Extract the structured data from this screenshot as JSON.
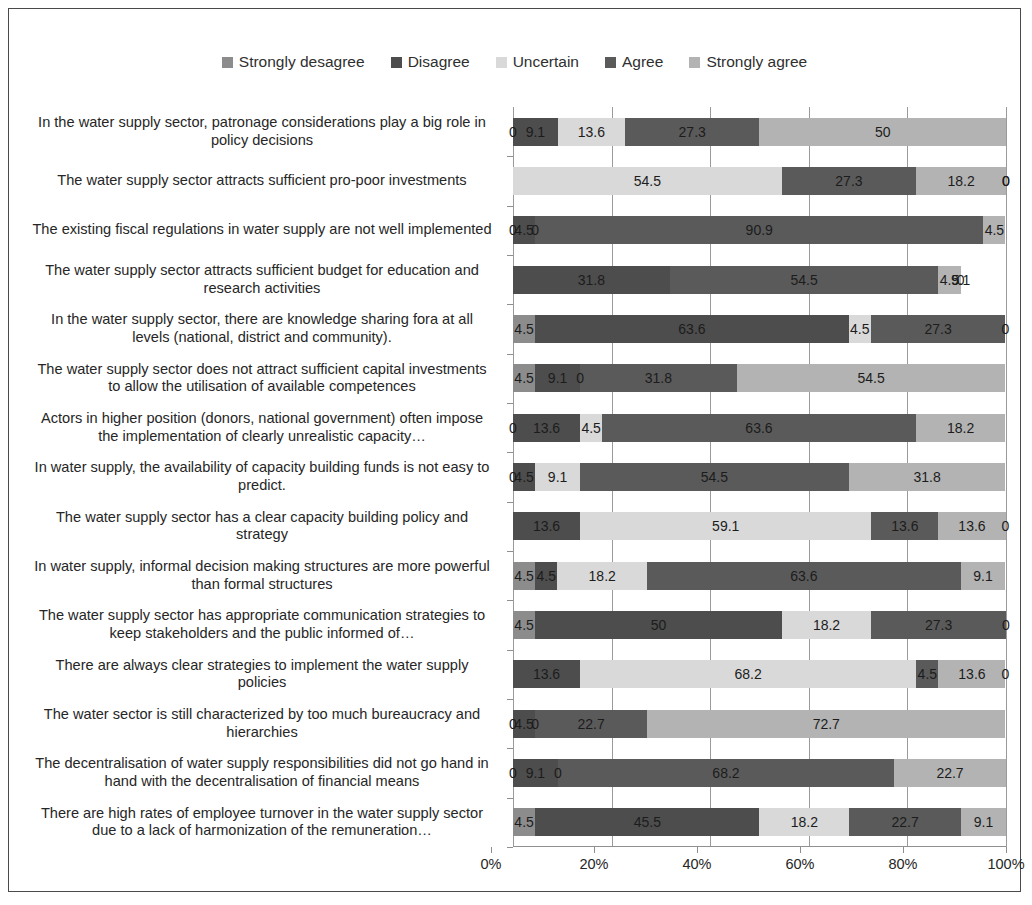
{
  "chart_data": {
    "type": "bar",
    "subtype": "stacked-horizontal-100-percent",
    "title": "",
    "xlabel": "",
    "ylabel": "",
    "xlim": [
      0,
      100
    ],
    "xticks": [
      "0%",
      "20%",
      "40%",
      "60%",
      "80%",
      "100%"
    ],
    "xtick_values": [
      0,
      20,
      40,
      60,
      80,
      100
    ],
    "grid": true,
    "legend_position": "top-center",
    "series": [
      {
        "name": "Strongly desagree",
        "color": "#8c8c8c"
      },
      {
        "name": "Disagree",
        "color": "#4d4d4d"
      },
      {
        "name": "Uncertain",
        "color": "#d9d9d9"
      },
      {
        "name": "Agree",
        "color": "#5a5a5a"
      },
      {
        "name": "Strongly agree",
        "color": "#b3b3b3"
      }
    ],
    "categories": [
      "In the water supply sector, patronage considerations play a big role in policy decisions",
      "The water supply sector attracts sufficient pro-poor investments",
      "The existing fiscal regulations in water supply are not well implemented",
      "The water supply sector attracts sufficient budget for education and research activities",
      "In the water supply sector, there are knowledge sharing fora at all levels (national, district and community).",
      "The water supply sector does not attract sufficient capital investments to allow the utilisation of available competences",
      "Actors in higher position (donors, national government) often impose the implementation of clearly unrealistic capacity…",
      "In water supply, the availability of capacity building funds is not easy to predict.",
      "The water supply sector has a clear capacity building policy and strategy",
      "In water supply, informal decision making structures are more powerful than formal structures",
      "The water supply sector has appropriate communication strategies to keep stakeholders and the public informed of…",
      "There are always clear strategies to implement the water supply policies",
      "The water sector is still characterized by too much bureaucracy and hierarchies",
      "The decentralisation of water supply responsibilities did not go hand in hand with the decentralisation of financial means",
      "There are high rates of employee turnover in the water supply sector due to a lack of harmonization of the remuneration…"
    ],
    "rows": [
      {
        "values": [
          0,
          9.1,
          13.6,
          27.3,
          50
        ],
        "labels": [
          "0",
          "9.1",
          "13.6",
          "27.3",
          "50"
        ]
      },
      {
        "values": [
          0,
          0,
          54.5,
          27.3,
          18.2
        ],
        "labels": [
          "",
          "",
          "54.5",
          "27.3",
          "18.2"
        ],
        "extra_zero_labels": [
          "0",
          "0"
        ]
      },
      {
        "values": [
          0,
          4.5,
          0,
          90.9,
          4.5
        ],
        "labels": [
          "0",
          "4.5",
          "0",
          "90.9",
          "4.5"
        ]
      },
      {
        "values": [
          0,
          31.8,
          0,
          54.5,
          4.5
        ],
        "labels": [
          "",
          "31.8",
          "",
          "54.5",
          "4.5"
        ],
        "extra_zero_labels": [
          "9.1",
          "0"
        ]
      },
      {
        "values": [
          4.5,
          63.6,
          4.5,
          27.3,
          0
        ],
        "labels": [
          "4.5",
          "63.6",
          "4.5",
          "27.3",
          "0"
        ]
      },
      {
        "values": [
          4.5,
          9.1,
          0,
          31.8,
          54.5
        ],
        "labels": [
          "4.5",
          "9.1",
          "0",
          "31.8",
          "54.5"
        ]
      },
      {
        "values": [
          0,
          13.6,
          4.5,
          63.6,
          18.2
        ],
        "labels": [
          "0",
          "13.6",
          "4.5",
          "63.6",
          "18.2"
        ]
      },
      {
        "values": [
          0,
          4.5,
          9.1,
          54.5,
          31.8
        ],
        "labels": [
          "0",
          "4.5",
          "9.1",
          "54.5",
          "31.8"
        ]
      },
      {
        "values": [
          0,
          13.6,
          59.1,
          13.6,
          13.6
        ],
        "labels": [
          "",
          "13.6",
          "59.1",
          "13.6",
          "13.6"
        ],
        "extra_zero_labels": [
          "0"
        ]
      },
      {
        "values": [
          4.5,
          4.5,
          18.2,
          63.6,
          9.1
        ],
        "labels": [
          "4.5",
          "4.5",
          "18.2",
          "63.6",
          "9.1"
        ]
      },
      {
        "values": [
          4.5,
          50,
          18.2,
          27.3,
          0
        ],
        "labels": [
          "4.5",
          "50",
          "18.2",
          "27.3",
          "0"
        ]
      },
      {
        "values": [
          0,
          13.6,
          68.2,
          4.5,
          13.6
        ],
        "labels": [
          "",
          "13.6",
          "68.2",
          "4.5",
          "13.6"
        ],
        "extra_zero_labels": [
          "0"
        ]
      },
      {
        "values": [
          0,
          4.5,
          0,
          22.7,
          72.7
        ],
        "labels": [
          "0",
          "4.5",
          "0",
          "22.7",
          "72.7"
        ]
      },
      {
        "values": [
          0,
          9.1,
          0,
          68.2,
          22.7
        ],
        "labels": [
          "0",
          "9.1",
          "0",
          "68.2",
          "22.7"
        ]
      },
      {
        "values": [
          4.5,
          45.5,
          18.2,
          22.7,
          9.1
        ],
        "labels": [
          "4.5",
          "45.5",
          "18.2",
          "22.7",
          "9.1"
        ]
      }
    ]
  },
  "legend": {
    "items": [
      {
        "label": "Strongly desagree",
        "color": "#8c8c8c"
      },
      {
        "label": "Disagree",
        "color": "#4d4d4d"
      },
      {
        "label": "Uncertain",
        "color": "#d9d9d9"
      },
      {
        "label": "Agree",
        "color": "#5a5a5a"
      },
      {
        "label": "Strongly agree",
        "color": "#b3b3b3"
      }
    ]
  }
}
